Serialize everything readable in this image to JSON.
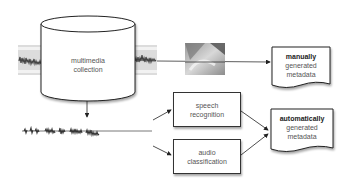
{
  "diagram": {
    "collection": {
      "line1": "multimedia",
      "line2": "collection"
    },
    "manual_metadata": {
      "bold": "manually",
      "line2": "generated",
      "line3": "metadata"
    },
    "speech_recognition": {
      "line1": "speech",
      "line2": "recognition"
    },
    "audio_classification": {
      "line1": "audio",
      "line2": "classification"
    },
    "auto_metadata": {
      "bold": "automatically",
      "line2": "generated",
      "line3": "metadata"
    },
    "icons": {
      "film_left": "film-strip-icon",
      "film_right": "film-strip-icon",
      "photo": "handwriting-photo",
      "waveform": "audio-waveform-icon"
    },
    "colors": {
      "stroke": "#333333",
      "text": "#555555",
      "bold_text": "#222222",
      "film": "#d9d9d9"
    }
  }
}
